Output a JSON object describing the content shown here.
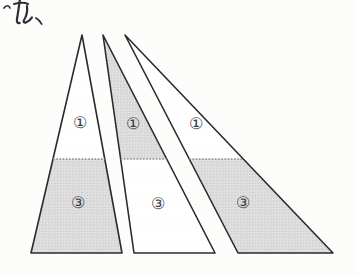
{
  "figure": {
    "canvas": {
      "width": 358,
      "height": 277
    },
    "background_color": "#fdfdfc",
    "stroke_color": "#2b2b2b",
    "shade_color": "#d9d9d9",
    "dotted_line_color": "#8a8a8a",
    "label_color": "#3a3a3a",
    "apex_y": 35,
    "base_y": 253,
    "divider_y": 159,
    "annotation": {
      "name": "handwritten-note",
      "text": "っれ、",
      "position": {
        "x": 4,
        "y": 4
      }
    },
    "triangles": [
      {
        "id": "triangle-1",
        "apex": {
          "x": 82,
          "y": 35
        },
        "base_left": {
          "x": 31,
          "y": 253
        },
        "base_right": {
          "x": 122,
          "y": 253
        },
        "upper": {
          "label": "①",
          "shaded": false,
          "label_pos": {
            "x": 80,
            "y": 122
          }
        },
        "lower": {
          "label": "③",
          "shaded": true,
          "label_pos": {
            "x": 78,
            "y": 202
          }
        }
      },
      {
        "id": "triangle-2",
        "apex": {
          "x": 103,
          "y": 35
        },
        "base_left": {
          "x": 134,
          "y": 253
        },
        "base_right": {
          "x": 215,
          "y": 253
        },
        "upper": {
          "label": "①",
          "shaded": true,
          "label_pos": {
            "x": 133,
            "y": 123
          }
        },
        "lower": {
          "label": "③",
          "shaded": false,
          "label_pos": {
            "x": 158,
            "y": 203
          }
        }
      },
      {
        "id": "triangle-3",
        "apex": {
          "x": 125,
          "y": 35
        },
        "base_left": {
          "x": 238,
          "y": 253
        },
        "base_right": {
          "x": 333,
          "y": 253
        },
        "upper": {
          "label": "①",
          "shaded": false,
          "label_pos": {
            "x": 196,
            "y": 123
          }
        },
        "lower": {
          "label": "③",
          "shaded": true,
          "label_pos": {
            "x": 243,
            "y": 202
          }
        }
      }
    ]
  }
}
